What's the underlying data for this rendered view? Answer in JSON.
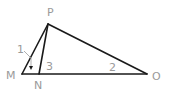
{
  "diagram": {
    "type": "geometry-triangle",
    "points": {
      "M": {
        "label": "M",
        "x": 22,
        "y": 74
      },
      "N": {
        "label": "N",
        "x": 39,
        "y": 74
      },
      "O": {
        "label": "O",
        "x": 147,
        "y": 74
      },
      "P": {
        "label": "P",
        "x": 48,
        "y": 24
      }
    },
    "segments": [
      "PM",
      "PN",
      "PO",
      "MO"
    ],
    "angle_labels": {
      "a1": "1",
      "a2": "2",
      "a3": "3"
    },
    "colors": {
      "line": "#1a1a1a",
      "label": "#9a9a9a"
    }
  }
}
